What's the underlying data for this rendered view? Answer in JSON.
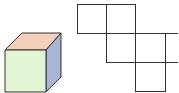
{
  "diagram": {
    "cube": {
      "colors": {
        "top": "#f6cfbb",
        "front": "#e4f5d6",
        "side": "#a9b5d6",
        "edge": "#333333"
      }
    },
    "net": {
      "square_count": 6,
      "line_color": "#333333"
    }
  }
}
